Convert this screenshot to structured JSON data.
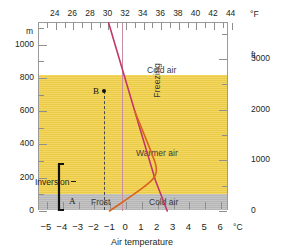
{
  "chart_data": {
    "type": "line",
    "xlabel": "Air temperature",
    "ylabel": "m",
    "xlabel_unit_c": "°C",
    "xlabel_unit_f": "°F",
    "ylabel_left_unit": "m",
    "ylabel_right_unit": "ft",
    "xlim_c": [
      -5.5,
      6.5
    ],
    "ylim_m": [
      0,
      1130
    ],
    "grid": false,
    "legend": "none",
    "x_ticks_celsius": [
      -5,
      -4,
      -3,
      -2,
      -1,
      0,
      1,
      2,
      3,
      4,
      5,
      6
    ],
    "x_ticks_celsius_labels": [
      "−5",
      "−4",
      "−3",
      "−2",
      "−1",
      "0",
      "1",
      "2",
      "3",
      "4",
      "5",
      "6"
    ],
    "x_ticks_fahrenheit": [
      24,
      26,
      28,
      30,
      32,
      34,
      36,
      38,
      40,
      42,
      44
    ],
    "x_ticks_fahrenheit_labels": [
      "24",
      "26",
      "28",
      "30",
      "32",
      "34",
      "36",
      "38",
      "40",
      "42",
      "44"
    ],
    "y_ticks_meters": [
      0,
      200,
      400,
      600,
      800,
      1000
    ],
    "y_ticks_meters_labels": [
      "0",
      "200",
      "400",
      "600",
      "800",
      "1000"
    ],
    "y_minor_meters": [
      100,
      300,
      500,
      700,
      900,
      1100
    ],
    "y_ticks_feet": [
      0,
      1000,
      2000,
      3000
    ],
    "y_ticks_feet_labels": [
      "0",
      "1000",
      "2000",
      "3000"
    ],
    "series": [
      {
        "name": "normal-lapse-rate",
        "color": "#c0396a",
        "points_c_m": [
          [
            -1.1,
            1130
          ],
          [
            0.55,
            600
          ],
          [
            1.85,
            185
          ],
          [
            2.6,
            0
          ]
        ]
      },
      {
        "name": "inversion-profile",
        "color": "#d9641e",
        "points_c_m": [
          [
            -1.05,
            0
          ],
          [
            0.35,
            90
          ],
          [
            1.35,
            160
          ],
          [
            1.85,
            205
          ],
          [
            1.95,
            260
          ],
          [
            1.65,
            340
          ],
          [
            1.1,
            470
          ],
          [
            0.55,
            600
          ]
        ]
      }
    ],
    "reference_lines": [
      {
        "name": "freezing-line",
        "value_c": 0,
        "color": "#c98fa0",
        "style": "solid"
      },
      {
        "name": "point-b-dashed-guide",
        "value_c": -1.1,
        "color": "#333333",
        "style": "dashed"
      }
    ],
    "bands": [
      {
        "name": "warmer-air-band",
        "from_m": 0,
        "to_m": 600,
        "color": "#f2d24b"
      },
      {
        "name": "ground-surface-band",
        "from_m": 0,
        "to_m": 50,
        "color": "#bcbcbc"
      }
    ],
    "annotations": [
      {
        "name": "point-a",
        "label": "A",
        "value_c": -1.05,
        "value_m": 0
      },
      {
        "name": "point-b",
        "label": "B",
        "value_c": -1.1,
        "value_m": 790
      },
      {
        "name": "freezing",
        "label": "Freezing",
        "orientation": "vertical"
      },
      {
        "name": "cold-air-upper",
        "label": "Cold air"
      },
      {
        "name": "warmer-air",
        "label": "Warmer air"
      },
      {
        "name": "frost",
        "label": "Frost"
      },
      {
        "name": "cold-air-lower",
        "label": "Cold air"
      },
      {
        "name": "inversion-bracket",
        "label": "Inversion",
        "from_m": 0,
        "to_m": 230
      }
    ],
    "colors": {
      "warm_band": "#f2d24b",
      "ground_band": "#bcbcbc",
      "lapse_line": "#c0396a",
      "inversion_line": "#d9641e",
      "freezing_line": "#c98fa0",
      "frame": "#9a9a9a",
      "text": "#231f20"
    }
  },
  "axes": {
    "top": {
      "unit": "°F"
    },
    "bottom": {
      "unit": "°C",
      "title": "Air temperature"
    },
    "left": {
      "unit": "m",
      "zero": "0"
    },
    "right": {
      "unit": "ft",
      "zero": "0"
    }
  },
  "labels": {
    "freezing": "Freezing",
    "cold_air_upper": "Cold air",
    "warmer_air": "Warmer air",
    "frost": "Frost",
    "cold_air_lower": "Cold air",
    "inversion": "Inversion",
    "point_a": "A",
    "point_b": "B"
  }
}
